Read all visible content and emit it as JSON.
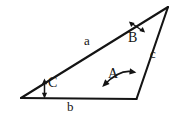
{
  "figure": {
    "type": "geometry-diagram",
    "shape": "triangle",
    "background_color": "#ffffff",
    "stroke_color": "#141414",
    "text_color": "#141414"
  },
  "vertices": [
    {
      "name": "left-vertex",
      "x": 21,
      "y": 98,
      "angle_label": "C"
    },
    {
      "name": "bottom-right-vertex",
      "x": 136,
      "y": 99,
      "angle_label": "A"
    },
    {
      "name": "top-right-vertex",
      "x": 168,
      "y": 7,
      "angle_label": "B"
    }
  ],
  "sides": {
    "a": {
      "label": "a",
      "from": "left-vertex",
      "to": "top-right-vertex"
    },
    "b": {
      "label": "b",
      "from": "left-vertex",
      "to": "bottom-right-vertex"
    },
    "c": {
      "label": "c",
      "from": "bottom-right-vertex",
      "to": "top-right-vertex"
    }
  },
  "angles": {
    "A": {
      "label": "A",
      "at": "bottom-right-vertex",
      "marker": "curved-double-arrow"
    },
    "B": {
      "label": "B",
      "at": "top-right-vertex",
      "marker": "straight-double-arrow"
    },
    "C": {
      "label": "C",
      "at": "left-vertex",
      "marker": "vertical-double-arrow"
    }
  },
  "icons": {
    "angle_a_arrow": "curved-double-arrow-icon",
    "angle_b_arrow": "double-arrow-icon",
    "angle_c_arrow": "vertical-double-arrow-icon"
  }
}
